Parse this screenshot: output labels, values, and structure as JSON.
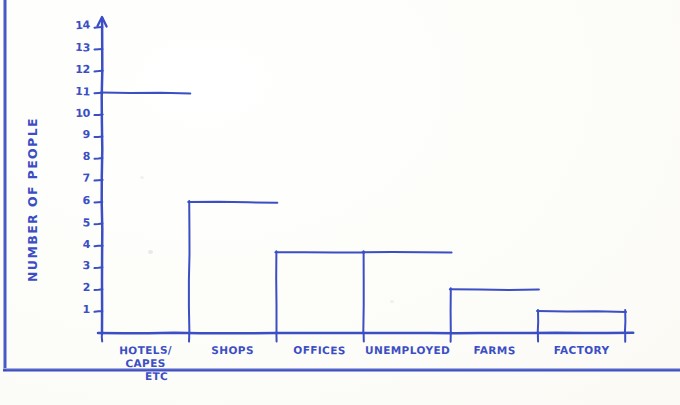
{
  "chart_data": {
    "type": "bar",
    "title": "",
    "xlabel": "",
    "ylabel": "NUMBER OF PEOPLE",
    "categories": [
      "HOTELS/ CAPES ETC",
      "SHOPS",
      "OFFICES",
      "UNEMPLOYED",
      "FARMS",
      "FACTORY"
    ],
    "category_lines": [
      [
        "HOTELS/",
        "CAPES",
        "ETC"
      ],
      [
        "SHOPS"
      ],
      [
        "OFFICES"
      ],
      [
        "UNEMPLOYED"
      ],
      [
        "FARMS"
      ],
      [
        "FACTORY"
      ]
    ],
    "values": [
      11,
      6,
      3.7,
      3.7,
      2,
      1
    ],
    "ylim": [
      0,
      14
    ],
    "yticks": [
      1,
      2,
      3,
      4,
      5,
      6,
      7,
      8,
      9,
      10,
      11,
      12,
      13,
      14
    ],
    "ytick_labels": [
      "1",
      "2",
      "3",
      "4",
      "5",
      "6",
      "7",
      "8",
      "9",
      "10",
      "11",
      "12",
      "13",
      "14"
    ],
    "grid": false,
    "legend": null,
    "style": "hand-drawn outlined bars, adjacent (histogram style), blue ballpoint ink on paper",
    "ink_color": "#3b4ec4",
    "paper_color": "#fdfdfa"
  },
  "frame": {
    "border_color": "#3647bb",
    "description": "photocopy page border rule on left and bottom edges"
  }
}
